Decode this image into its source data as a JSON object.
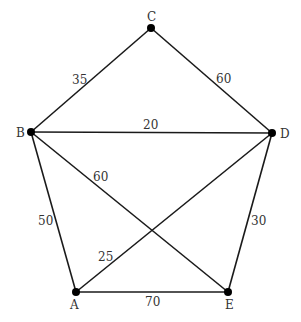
{
  "diagram": {
    "type": "weighted-graph",
    "nodes": [
      {
        "id": "A",
        "label": "A",
        "x": 76,
        "y": 292
      },
      {
        "id": "B",
        "label": "B",
        "x": 31,
        "y": 132
      },
      {
        "id": "C",
        "label": "C",
        "x": 151,
        "y": 28
      },
      {
        "id": "D",
        "label": "D",
        "x": 272,
        "y": 133
      },
      {
        "id": "E",
        "label": "E",
        "x": 228,
        "y": 292
      }
    ],
    "edges": [
      {
        "from": "B",
        "to": "C",
        "weight": "35"
      },
      {
        "from": "C",
        "to": "D",
        "weight": "60"
      },
      {
        "from": "B",
        "to": "D",
        "weight": "20"
      },
      {
        "from": "B",
        "to": "E",
        "weight": "60"
      },
      {
        "from": "A",
        "to": "D",
        "weight": "25"
      },
      {
        "from": "A",
        "to": "B",
        "weight": "50"
      },
      {
        "from": "D",
        "to": "E",
        "weight": "30"
      },
      {
        "from": "A",
        "to": "E",
        "weight": "70"
      }
    ]
  }
}
